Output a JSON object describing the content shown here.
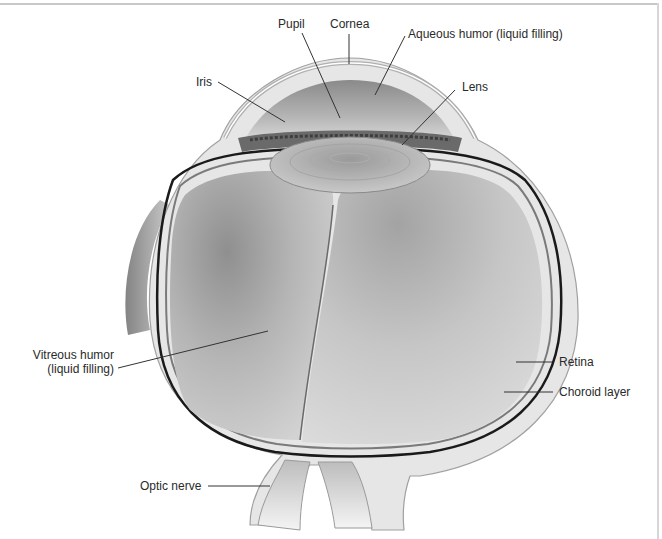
{
  "diagram": {
    "labels": {
      "pupil": "Pupil",
      "cornea": "Cornea",
      "aqueous_humor": "Aqueous humor (liquid filling)",
      "iris": "Iris",
      "lens": "Lens",
      "vitreous_humor_line1": "Vitreous humor",
      "vitreous_humor_line2": "(liquid filling)",
      "retina": "Retina",
      "choroid_layer": "Choroid layer",
      "optic_nerve": "Optic nerve"
    },
    "colors": {
      "background": "#ffffff",
      "label_text": "#2a2a2a",
      "leader_line": "#333333",
      "vitreous_fill": "#c9c9c9",
      "choroid_line": "#1a1a1a"
    }
  }
}
